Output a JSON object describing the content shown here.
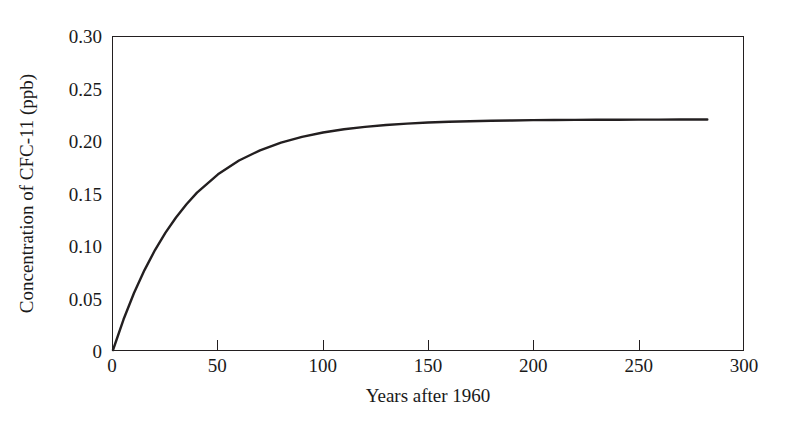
{
  "chart_data": {
    "type": "line",
    "title": "",
    "xlabel": "Years after 1960",
    "ylabel": "Concentration of CFC-11 (ppb)",
    "xlim": [
      0,
      300
    ],
    "ylim": [
      0,
      0.3
    ],
    "grid": false,
    "legend": null,
    "xticks": [
      {
        "value": 0,
        "label": "0"
      },
      {
        "value": 50,
        "label": "50"
      },
      {
        "value": 100,
        "label": "100"
      },
      {
        "value": 150,
        "label": "150"
      },
      {
        "value": 200,
        "label": "200"
      },
      {
        "value": 250,
        "label": "250"
      },
      {
        "value": 300,
        "label": "300"
      }
    ],
    "yticks": [
      {
        "value": 0,
        "label": "0"
      },
      {
        "value": 0.05,
        "label": "0.05"
      },
      {
        "value": 0.1,
        "label": "0.10"
      },
      {
        "value": 0.15,
        "label": "0.15"
      },
      {
        "value": 0.2,
        "label": "0.20"
      },
      {
        "value": 0.25,
        "label": "0.25"
      },
      {
        "value": 0.3,
        "label": "0.30"
      }
    ],
    "series": [
      {
        "name": "CFC-11 concentration",
        "color": "#231f20",
        "x": [
          0,
          5,
          10,
          15,
          20,
          25,
          30,
          35,
          40,
          50,
          60,
          70,
          80,
          90,
          100,
          110,
          120,
          130,
          140,
          150,
          160,
          170,
          180,
          190,
          200,
          210,
          220,
          230,
          240,
          250,
          260,
          270,
          280,
          283
        ],
        "y": [
          0.0,
          0.0292,
          0.0546,
          0.0766,
          0.0958,
          0.1125,
          0.127,
          0.1397,
          0.1508,
          0.1684,
          0.1816,
          0.1914,
          0.1988,
          0.2043,
          0.2085,
          0.2116,
          0.2139,
          0.2157,
          0.217,
          0.218,
          0.2187,
          0.2193,
          0.2197,
          0.22,
          0.2203,
          0.2204,
          0.2206,
          0.2207,
          0.2207,
          0.2208,
          0.2208,
          0.2209,
          0.2209,
          0.2209
        ]
      }
    ]
  },
  "axes": {
    "frame_color": "#231f20"
  }
}
